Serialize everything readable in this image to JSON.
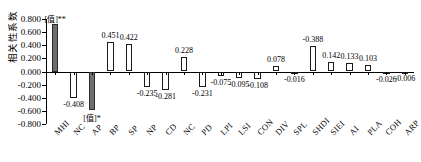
{
  "chart_data": {
    "type": "bar",
    "title": "",
    "subtitle": "",
    "xlabel": "",
    "ylabel": "相关性系数",
    "ylim": [
      -0.8,
      0.8
    ],
    "ytick_step": 0.2,
    "ytick_labels": [
      "0.800",
      "0.600",
      "0.400",
      "0.200",
      "0.000",
      "-0.200",
      "-0.400",
      "-0.600",
      "-0.800"
    ],
    "ytick_values": [
      0.8,
      0.6,
      0.4,
      0.2,
      0.0,
      -0.2,
      -0.4,
      -0.6,
      -0.8
    ],
    "grid": false,
    "legend": "none",
    "categories": [
      "MHI",
      "NC",
      "AP",
      "BP",
      "SP",
      "NP",
      "CD",
      "NC",
      "PD",
      "LPI",
      "LSI",
      "CON",
      "DIV",
      "SPL",
      "SHDI",
      "SIEI",
      "AI",
      "PLA",
      "COH",
      "ARP"
    ],
    "values": [
      0.72,
      -0.408,
      -0.58,
      0.451,
      0.422,
      -0.235,
      -0.281,
      0.228,
      -0.231,
      -0.075,
      -0.095,
      -0.108,
      0.078,
      -0.016,
      0.388,
      0.142,
      0.133,
      0.103,
      -0.026,
      -0.006
    ],
    "data_labels": [
      "[值]**",
      "-0.408",
      "[值]*",
      "0.451",
      "0.422",
      "-0.235",
      "-0.281",
      "0.228",
      "-0.231",
      "-0.075",
      "-0.095",
      "-0.108",
      "0.078",
      "-0.016",
      "-0.388",
      "0.142",
      "0.133",
      "0.103",
      "-0.026",
      "-0.006"
    ],
    "label_positions": [
      "above",
      "below",
      "below",
      "above",
      "above",
      "below",
      "below",
      "above",
      "below",
      "below",
      "below",
      "below",
      "above",
      "below",
      "above",
      "above",
      "above",
      "above",
      "below",
      "below"
    ],
    "highlighted": [
      true,
      false,
      true,
      false,
      false,
      false,
      false,
      false,
      false,
      false,
      false,
      false,
      false,
      false,
      false,
      false,
      false,
      false,
      false,
      false
    ],
    "colors": {
      "bar_fill_default": "#ffffff",
      "bar_fill_highlight": "#6e6e6e",
      "bar_stroke": "#1a1a1a",
      "axis": "#000000",
      "text": "#000000"
    }
  }
}
